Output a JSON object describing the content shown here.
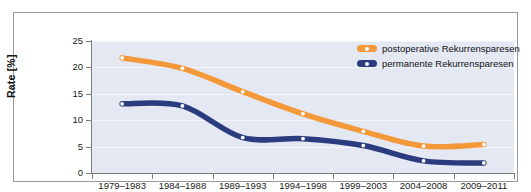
{
  "chart_data": {
    "type": "line",
    "title": "",
    "subtitle": "",
    "xlabel": "",
    "ylabel": "Rate [%]",
    "categories": [
      "1979–1983",
      "1984–1988",
      "1989–1993",
      "1994–1998",
      "1999–2003",
      "2004–2008",
      "2009–2011"
    ],
    "ylim": [
      0,
      25
    ],
    "yticks": [
      0,
      5,
      10,
      15,
      20,
      25
    ],
    "ytick_labels": [
      "0",
      "5",
      "10",
      "15",
      "20",
      "25"
    ],
    "grid": true,
    "legend_position": "top-right",
    "series": [
      {
        "name": "postoperative Rekurrensparesen",
        "color": "#f5983a",
        "marker": "circle-white",
        "values": [
          21.8,
          19.8,
          15.4,
          11.2,
          7.9,
          5.1,
          5.4
        ]
      },
      {
        "name": "permanente Rekurrensparesen",
        "color": "#2b3c7e",
        "marker": "circle-white",
        "values": [
          13.1,
          12.7,
          6.7,
          6.5,
          5.2,
          2.3,
          1.9
        ]
      }
    ]
  },
  "colors": {
    "plot_background": "#e3e8f3",
    "gridline": "#f4f6fb",
    "axis": "#7b7b7b",
    "frame_border": "#9a9a9a",
    "page_background": "#ffffff",
    "orange_series": "#f5983a",
    "blue_series": "#2b3c7e"
  }
}
